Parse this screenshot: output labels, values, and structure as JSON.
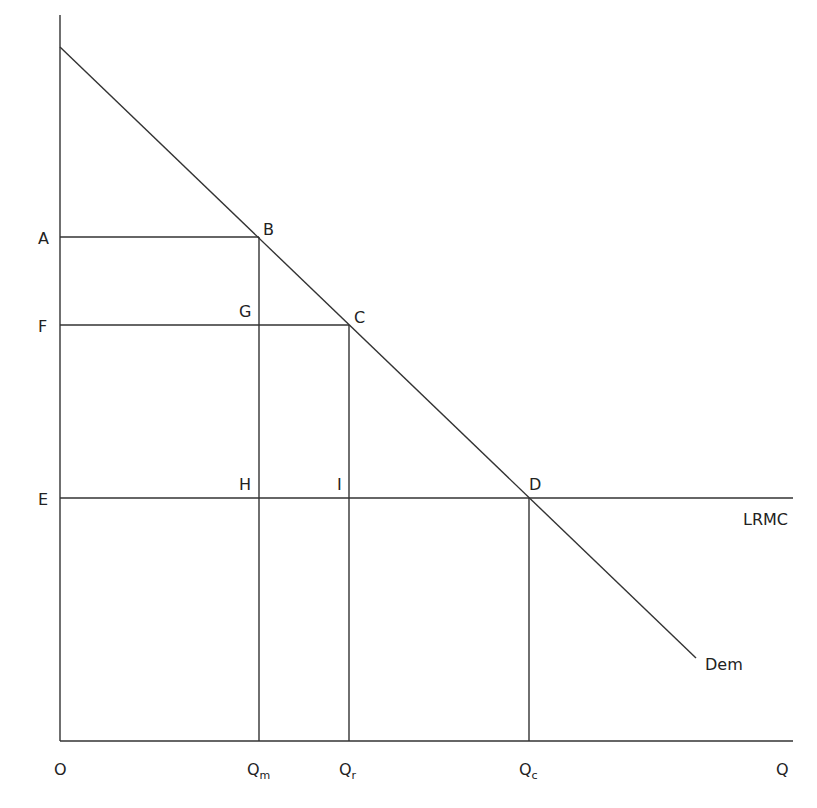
{
  "diagram": {
    "type": "economics-monopoly-vs-competition",
    "axes": {
      "origin_label": "O",
      "x_axis_label": "Q",
      "y_axis_label": ""
    },
    "price_labels": {
      "A": "A",
      "F": "F",
      "E": "E"
    },
    "point_labels": {
      "B": "B",
      "C": "C",
      "D": "D",
      "G": "G",
      "H": "H",
      "I": "I"
    },
    "quantity_labels": {
      "Qm": {
        "main": "Q",
        "sub": "m"
      },
      "Qr": {
        "main": "Q",
        "sub": "r"
      },
      "Qc": {
        "main": "Q",
        "sub": "c"
      }
    },
    "curves": {
      "demand": "Dem",
      "lrmc": "LRMC"
    },
    "line_color": "#333333"
  }
}
